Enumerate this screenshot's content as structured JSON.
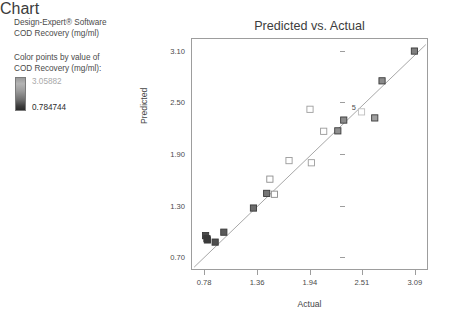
{
  "software": {
    "title": "Design-Expert® Software",
    "response": "COD Recovery (mg/ml)"
  },
  "legend": {
    "caption_line1": "Color points by value of",
    "caption_line2": "COD Recovery (mg/ml):",
    "high_value": "3.05882",
    "low_value": "0.784744",
    "high_color": "#b4b4b4",
    "low_color": "#2a2a2a"
  },
  "chart_data": {
    "type": "scatter",
    "title": "Predicted vs. Actual",
    "xlabel": "Actual",
    "ylabel": "Predicted",
    "xlim": [
      0.636,
      3.235
    ],
    "ylim": [
      0.555,
      3.245
    ],
    "xticks": [
      "0.78",
      "1.36",
      "1.94",
      "2.51",
      "3.09"
    ],
    "xtick_values": [
      0.78,
      1.36,
      1.94,
      2.51,
      3.09
    ],
    "yticks": [
      "0.70",
      "1.30",
      "1.90",
      "2.50",
      "3.10"
    ],
    "ytick_values": [
      0.7,
      1.3,
      1.9,
      2.5,
      3.1
    ],
    "grid": false,
    "legend_position": "none",
    "marker": "square",
    "reference_line": {
      "label": "identity line",
      "x": [
        0.66,
        3.2
      ],
      "y": [
        0.6,
        3.18
      ],
      "color": "#9d9d9d"
    },
    "points": [
      {
        "x": 0.785,
        "y": 0.965,
        "color": "#4a4a4a",
        "filled": true
      },
      {
        "x": 0.8,
        "y": 0.93,
        "color": "#3f3f3f",
        "filled": true
      },
      {
        "x": 0.805,
        "y": 0.915,
        "color": "#3a3a3a",
        "filled": true
      },
      {
        "x": 0.89,
        "y": 0.89,
        "color": "#4f4f4f",
        "filled": true
      },
      {
        "x": 0.985,
        "y": 1.005,
        "color": "#5a5a5a",
        "filled": true
      },
      {
        "x": 1.31,
        "y": 1.285,
        "color": "#6d6d6d",
        "filled": true
      },
      {
        "x": 1.455,
        "y": 1.455,
        "color": "#767676",
        "filled": true
      },
      {
        "x": 1.49,
        "y": 1.62,
        "color": "#8d8d8d",
        "filled": false
      },
      {
        "x": 1.54,
        "y": 1.445,
        "color": "#8a8a8a",
        "filled": false
      },
      {
        "x": 1.7,
        "y": 1.835,
        "color": "#9a9a9a",
        "filled": false
      },
      {
        "x": 1.93,
        "y": 2.43,
        "color": "#9e9e9e",
        "filled": false
      },
      {
        "x": 1.945,
        "y": 1.81,
        "color": "#9c9c9c",
        "filled": false
      },
      {
        "x": 2.08,
        "y": 2.175,
        "color": "#9a9a9a",
        "filled": false
      },
      {
        "x": 2.235,
        "y": 2.18,
        "color": "#8f8f8f",
        "filled": true
      },
      {
        "x": 2.3,
        "y": 2.305,
        "color": "#8b8b8b",
        "filled": true
      },
      {
        "x": 2.495,
        "y": 2.4,
        "color": "#bdbdbd",
        "filled": false,
        "annotation": "5"
      },
      {
        "x": 2.64,
        "y": 2.33,
        "color": "#a0a0a0",
        "filled": true
      },
      {
        "x": 2.72,
        "y": 2.76,
        "color": "#8a8a8a",
        "filled": true
      },
      {
        "x": 3.075,
        "y": 3.105,
        "color": "#7f7f7f",
        "filled": true
      }
    ]
  }
}
